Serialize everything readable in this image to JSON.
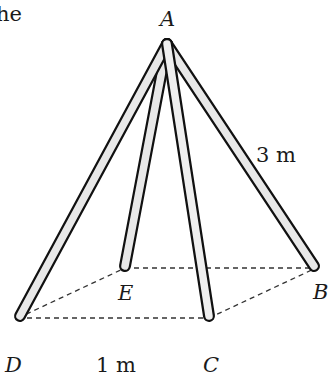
{
  "partial_text": "he",
  "vertices": {
    "A": {
      "label": "A",
      "x": 167,
      "y": 42
    },
    "B": {
      "label": "B",
      "x": 316,
      "y": 268
    },
    "C": {
      "label": "C",
      "x": 209,
      "y": 318
    },
    "D": {
      "label": "D",
      "x": 18,
      "y": 318
    },
    "E": {
      "label": "E",
      "x": 125,
      "y": 268
    }
  },
  "measurements": {
    "pole_length": "3 m",
    "base_side": "1 m"
  },
  "colors": {
    "outline": "#111111",
    "pole_fill": "#e6e6e6",
    "dashed": "#333333"
  }
}
